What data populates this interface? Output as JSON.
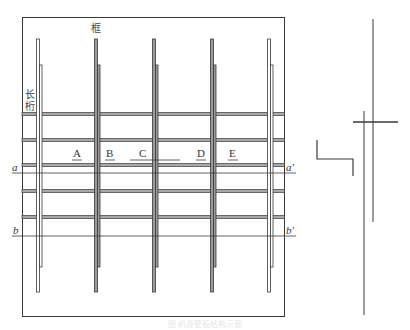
{
  "diagram": {
    "labels": {
      "frame": "框",
      "stringer_line1": "长",
      "stringer_line2": "桁",
      "section_a_left": "a",
      "section_a_right": "a'",
      "section_b_left": "b",
      "section_b_right": "b'"
    },
    "bays": [
      {
        "label": "A",
        "x": 77
      },
      {
        "label": "B",
        "x": 110
      },
      {
        "label": "C",
        "x": 143
      },
      {
        "label": "D",
        "x": 201
      },
      {
        "label": "E",
        "x": 233
      }
    ],
    "caption": "图  机身壁板结构示意",
    "colors": {
      "line": "#3a3a3a",
      "member_fill": "#9a9a9a",
      "band_fill": "#a8a8a8",
      "background": "#ffffff"
    },
    "panel": {
      "x": 22,
      "y": 17,
      "width": 262,
      "height": 299
    },
    "frames_x": [
      38,
      96,
      154,
      212,
      269
    ],
    "stringer_bands_y": [
      114,
      140,
      165,
      191,
      217
    ],
    "section_lines": {
      "a_y": 173,
      "b_y": 236
    },
    "detail_view": {
      "long_line_1": {
        "x": 373,
        "y1": 19,
        "y2": 222
      },
      "long_line_2": {
        "x": 364,
        "y1": 111,
        "y2": 315
      },
      "cross_line": {
        "y": 122,
        "x1": 353,
        "x2": 398
      },
      "bracket": {
        "x1": 317,
        "y_top": 140,
        "y_mid": 159,
        "x2": 353,
        "y_bottom": 176
      }
    }
  }
}
